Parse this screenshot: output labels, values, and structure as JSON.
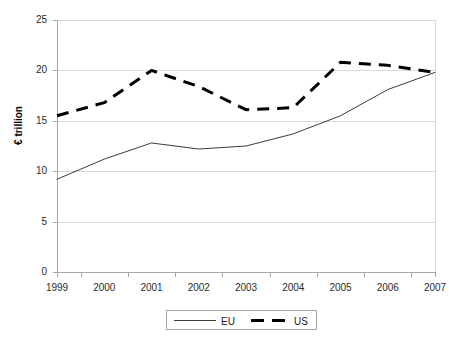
{
  "chart_data": {
    "type": "line",
    "title": "",
    "subtitle": "",
    "xlabel": "",
    "ylabel": "€ trillion",
    "x": [
      1999,
      2000,
      2001,
      2002,
      2003,
      2004,
      2005,
      2006,
      2007
    ],
    "categories": [
      "1999",
      "2000",
      "2001",
      "2002",
      "2003",
      "2004",
      "2005",
      "2006",
      "2007"
    ],
    "series": [
      {
        "name": "EU",
        "style": "solid",
        "color": "#3b3b3b",
        "values": [
          9.2,
          11.2,
          12.8,
          12.2,
          12.5,
          13.7,
          15.5,
          18.1,
          19.8
        ]
      },
      {
        "name": "US",
        "style": "dashed",
        "color": "#000000",
        "values": [
          15.5,
          16.8,
          20.0,
          18.4,
          16.1,
          16.3,
          20.8,
          20.5,
          19.8
        ]
      }
    ],
    "ylim": [
      0,
      25
    ],
    "yticks": [
      0,
      5,
      10,
      15,
      20,
      25
    ],
    "ytick_labels": [
      "0",
      "5",
      "10",
      "15",
      "20",
      "25"
    ],
    "xlim": [
      1999,
      2007
    ],
    "grid": "horizontal",
    "legend_position": "bottom",
    "legend_entries": [
      "EU",
      "US"
    ]
  },
  "axes": {
    "y_title": "€ trillion"
  },
  "legend": {
    "eu_label": "EU",
    "us_label": "US"
  },
  "colors": {
    "plot_border": "#d9d9d9",
    "gridline": "#d9d9d9",
    "axis_line": "#a6a6a6",
    "eu_line": "#3b3b3b",
    "us_line": "#000000",
    "tick_text": "#2b2b2b",
    "background": "#ffffff"
  },
  "geometry": {
    "plot_left": 57,
    "plot_right": 435,
    "plot_top": 20,
    "plot_bottom": 272
  }
}
